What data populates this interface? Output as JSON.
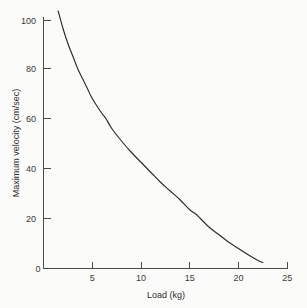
{
  "chart_data": {
    "type": "line",
    "title": "",
    "subtitle": "",
    "xlabel": "Load (kg)",
    "ylabel": "Maximum velocity (cm/sec)",
    "xlim": [
      0,
      25
    ],
    "ylim": [
      0,
      103
    ],
    "grid": false,
    "legend": false,
    "legend_position": "none",
    "xticks": [
      0,
      5,
      10,
      15,
      20,
      25
    ],
    "xticklabels": [
      "0",
      "5",
      "10",
      "15",
      "20",
      "25"
    ],
    "yticks": [
      0,
      20,
      40,
      60,
      80,
      100
    ],
    "yticklabels": [
      "0",
      "20",
      "40",
      "60",
      "80",
      "100"
    ],
    "series": [
      {
        "name": "Force-velocity curve",
        "x": [
          1.5,
          2.0,
          2.5,
          3.0,
          3.5,
          4.0,
          4.5,
          5.0,
          6.0,
          6.4,
          7.0,
          8.0,
          9.0,
          10.0,
          11.0,
          12.0,
          13.0,
          14.0,
          15.0,
          15.7,
          17.0,
          18.0,
          19.0,
          20.0,
          21.0,
          22.0,
          22.5
        ],
        "y": [
          103.0,
          96.0,
          90.0,
          85.0,
          80.0,
          76.0,
          72.0,
          68.0,
          62.0,
          60.0,
          56.0,
          51.0,
          46.5,
          42.5,
          38.5,
          34.5,
          31.0,
          27.5,
          23.5,
          21.5,
          16.5,
          13.5,
          10.5,
          8.0,
          5.5,
          3.2,
          2.4
        ]
      }
    ],
    "annotations": []
  },
  "axes": {
    "x_title": "Load (kg)",
    "y_title": "Maximum velocity (cm/sec)"
  }
}
